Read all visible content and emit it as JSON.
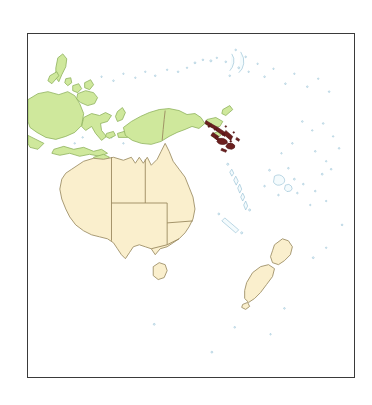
{
  "figure": {
    "type": "locator-map",
    "region": "Oceania / Western Pacific",
    "projection_hint": "equirectangular",
    "frame": {
      "x": 27,
      "y": 33,
      "width": 328,
      "height": 345,
      "border_color": "#3a3a3a",
      "border_width_px": 1.4
    },
    "background_color": "#ffffff",
    "ocean_color": "#ffffff"
  },
  "colors": {
    "highlight_fill": "#6b1f1f",
    "highlight_stroke": "#4a1212",
    "land_cream_fill": "#faefcd",
    "land_cream_stroke": "#9f9068",
    "land_green_fill": "#cfe89c",
    "land_green_stroke": "#8fb25e",
    "minor_island_stroke": "#9fc6d8",
    "minor_island_fill": "#f4fbfd",
    "internal_border": "#9a8a5f",
    "frame": "#3a3a3a",
    "page_background": "#ffffff"
  },
  "legend": {
    "visible": false,
    "entries": []
  },
  "labels": {
    "visible": false,
    "items": []
  },
  "highlighted_region": {
    "name": "Solomon Islands",
    "fill": "#6b1f1f",
    "description": "Double chain of islands highlighted dark maroon, northeast of New Guinea",
    "approx_center": {
      "x": 215,
      "y": 128
    }
  },
  "land_masses": [
    {
      "name": "Australia",
      "style": "cream",
      "has_internal_borders": true
    },
    {
      "name": "Tasmania",
      "style": "cream",
      "has_internal_borders": false
    },
    {
      "name": "New Zealand North Island",
      "style": "cream",
      "has_internal_borders": false
    },
    {
      "name": "New Zealand South Island",
      "style": "cream",
      "has_internal_borders": false
    },
    {
      "name": "Papua New Guinea",
      "style": "green",
      "has_internal_borders": true
    },
    {
      "name": "Western New Guinea",
      "style": "green",
      "has_internal_borders": true
    },
    {
      "name": "Borneo",
      "style": "green",
      "has_internal_borders": false
    },
    {
      "name": "Sulawesi",
      "style": "green",
      "has_internal_borders": false
    },
    {
      "name": "Philippines",
      "style": "green",
      "has_internal_borders": false
    },
    {
      "name": "Lesser Sunda Islands",
      "style": "green",
      "has_internal_borders": false
    },
    {
      "name": "Maluku Islands",
      "style": "green",
      "has_internal_borders": false
    },
    {
      "name": "New Britain",
      "style": "green",
      "has_internal_borders": false
    },
    {
      "name": "Solomon Islands",
      "style": "highlight",
      "has_internal_borders": false
    },
    {
      "name": "Vanuatu",
      "style": "minor",
      "has_internal_borders": false
    },
    {
      "name": "New Caledonia",
      "style": "minor",
      "has_internal_borders": false
    },
    {
      "name": "Fiji",
      "style": "minor",
      "has_internal_borders": false
    },
    {
      "name": "Micronesia",
      "style": "minor",
      "has_internal_borders": false
    },
    {
      "name": "Marshall Islands",
      "style": "minor",
      "has_internal_borders": false
    },
    {
      "name": "Samoa and Tonga",
      "style": "minor",
      "has_internal_borders": false
    }
  ],
  "australia_states": [
    "Western Australia",
    "Northern Territory",
    "South Australia",
    "Queensland",
    "New South Wales",
    "Victoria"
  ]
}
